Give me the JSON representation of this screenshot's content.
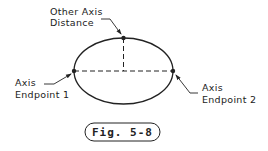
{
  "figure": {
    "labels": {
      "other_axis": [
        "Other Axis",
        "Distance"
      ],
      "endpoint1": [
        "Axis",
        "Endpoint 1"
      ],
      "endpoint2": [
        "Axis",
        "Endpoint 2"
      ]
    },
    "caption": "Fig. 5-8",
    "colors": {
      "stroke": "#222222",
      "background": "#ffffff"
    }
  }
}
